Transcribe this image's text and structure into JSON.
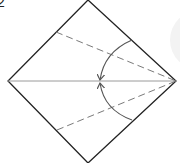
{
  "diagram": {
    "type": "origami-fold-instruction",
    "step_number": "2",
    "shape": "square-on-diamond",
    "vertices": {
      "top": [
        88,
        0
      ],
      "right": [
        176,
        81
      ],
      "bottom": [
        88,
        163
      ],
      "left": [
        8,
        81
      ]
    },
    "center_line": {
      "from": [
        8,
        81
      ],
      "to": [
        176,
        81
      ],
      "style": "solid-gray"
    },
    "fold_lines": [
      {
        "name": "upper-valley-fold",
        "from": [
          56,
          32
        ],
        "to": [
          176,
          81
        ],
        "style": "dashed"
      },
      {
        "name": "lower-valley-fold",
        "from": [
          57,
          130
        ],
        "to": [
          176,
          81
        ],
        "style": "dashed"
      }
    ],
    "arrows": [
      {
        "name": "upper-fold-arrow",
        "from": [
          132,
          40
        ],
        "to": [
          100,
          80
        ],
        "direction": "down-left"
      },
      {
        "name": "lower-fold-arrow",
        "from": [
          132,
          120
        ],
        "to": [
          100,
          83
        ],
        "direction": "up-left"
      }
    ],
    "colors": {
      "outline": "#222222",
      "center_line": "#9a9a9a",
      "dashed": "#7a7a7a",
      "arrow": "#555555",
      "bg_circle": "#f3f3f3"
    }
  }
}
